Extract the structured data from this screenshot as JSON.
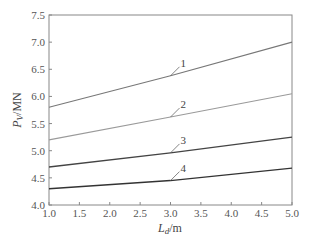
{
  "chart_data": {
    "type": "line",
    "title": "",
    "xlabel": "L_d/m",
    "xlabel_main": "L",
    "xlabel_sub": "d",
    "xlabel_unit": "/m",
    "ylabel": "P_V/MN",
    "ylabel_main": "P",
    "ylabel_sub": "V",
    "ylabel_unit": "/MN",
    "xlim": [
      1.0,
      5.0
    ],
    "ylim": [
      4.0,
      7.5
    ],
    "xticks": [
      "1.0",
      "1.5",
      "2.0",
      "2.5",
      "3.0",
      "3.5",
      "4.0",
      "4.5",
      "5.0"
    ],
    "yticks": [
      "4.0",
      "4.5",
      "5.0",
      "5.5",
      "6.0",
      "6.5",
      "7.0",
      "7.5"
    ],
    "grid": false,
    "legend": "inline numeric labels with leader lines",
    "x": [
      1.0,
      3.0,
      5.0
    ],
    "series": [
      {
        "name": "1",
        "values": [
          5.8,
          6.38,
          7.0
        ],
        "color": "#777777",
        "label_pos": [
          3.3,
          6.5
        ]
      },
      {
        "name": "2",
        "values": [
          5.2,
          5.62,
          6.05
        ],
        "color": "#9a9a9a",
        "label_pos": [
          3.3,
          5.7
        ]
      },
      {
        "name": "3",
        "values": [
          4.7,
          4.96,
          5.25
        ],
        "color": "#444444",
        "label_pos": [
          3.3,
          5.05
        ]
      },
      {
        "name": "4",
        "values": [
          4.3,
          4.45,
          4.68
        ],
        "color": "#333333",
        "label_pos": [
          3.3,
          4.6
        ]
      }
    ]
  }
}
